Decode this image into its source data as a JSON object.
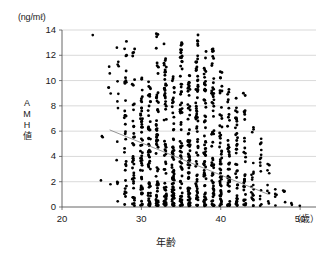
{
  "figure": {
    "y_unit_label": "(ng/mℓ)",
    "x_unit_label": "（歳）",
    "y_axis_title_chars": [
      "A",
      "M",
      "H",
      "値"
    ],
    "x_axis_title": "年齢"
  },
  "chart_data": {
    "type": "scatter",
    "title": "",
    "xlabel": "年齢",
    "ylabel": "AMH値",
    "y_unit": "ng/mℓ",
    "x_unit": "歳",
    "xlim": [
      20,
      52
    ],
    "ylim": [
      0,
      14
    ],
    "xticks": [
      20,
      30,
      40,
      50
    ],
    "yticks": [
      0,
      2,
      4,
      6,
      8,
      10,
      12,
      14
    ],
    "xtick_labels": [
      "20",
      "30",
      "40",
      "50"
    ],
    "ytick_labels": [
      "0",
      "2",
      "4",
      "6",
      "8",
      "10",
      "12",
      "14"
    ],
    "grid": "horizontal",
    "legend": "none",
    "marker_color": "#000000",
    "marker_shape": "circle",
    "trendline": {
      "present": true,
      "color": "#8a8a8a",
      "x_start": 26.0,
      "y_start": 6.1,
      "x_end": 46.0,
      "y_end": 1.0
    },
    "age_columns": [
      {
        "age": 24,
        "n": 1,
        "ymin": 13.6,
        "ymax": 13.6,
        "ytop": 13.6
      },
      {
        "age": 25,
        "n": 3,
        "ymin": 2.0,
        "ymax": 5.6,
        "ytop": 5.6
      },
      {
        "age": 26,
        "n": 6,
        "ymin": 1.7,
        "ymax": 11.1,
        "ytop": 11.1
      },
      {
        "age": 27,
        "n": 14,
        "ymin": 0.4,
        "ymax": 12.6,
        "ytop": 12.6
      },
      {
        "age": 28,
        "n": 34,
        "ymin": 0.1,
        "ymax": 13.1,
        "ytop": 13.1
      },
      {
        "age": 29,
        "n": 42,
        "ymin": 0.1,
        "ymax": 12.5,
        "ytop": 12.5
      },
      {
        "age": 30,
        "n": 52,
        "ymin": 0.1,
        "ymax": 10.2,
        "ytop": 10.2
      },
      {
        "age": 31,
        "n": 58,
        "ymin": 0.1,
        "ymax": 9.9,
        "ytop": 9.9
      },
      {
        "age": 32,
        "n": 62,
        "ymin": 0.1,
        "ymax": 13.7,
        "ytop": 13.7
      },
      {
        "age": 33,
        "n": 66,
        "ymin": 0.1,
        "ymax": 12.9,
        "ytop": 12.9
      },
      {
        "age": 34,
        "n": 70,
        "ymin": 0.1,
        "ymax": 10.3,
        "ytop": 10.3
      },
      {
        "age": 35,
        "n": 74,
        "ymin": 0.1,
        "ymax": 13.0,
        "ytop": 13.0
      },
      {
        "age": 36,
        "n": 72,
        "ymin": 0.1,
        "ymax": 10.4,
        "ytop": 10.4
      },
      {
        "age": 37,
        "n": 70,
        "ymin": 0.1,
        "ymax": 13.6,
        "ytop": 13.6
      },
      {
        "age": 38,
        "n": 66,
        "ymin": 0.1,
        "ymax": 12.3,
        "ytop": 12.3
      },
      {
        "age": 39,
        "n": 60,
        "ymin": 0.1,
        "ymax": 12.5,
        "ytop": 12.5
      },
      {
        "age": 40,
        "n": 54,
        "ymin": 0.1,
        "ymax": 10.7,
        "ytop": 10.7
      },
      {
        "age": 41,
        "n": 46,
        "ymin": 0.1,
        "ymax": 9.3,
        "ytop": 9.3
      },
      {
        "age": 42,
        "n": 40,
        "ymin": 0.1,
        "ymax": 8.6,
        "ytop": 8.6
      },
      {
        "age": 43,
        "n": 32,
        "ymin": 0.1,
        "ymax": 9.0,
        "ytop": 9.0
      },
      {
        "age": 44,
        "n": 22,
        "ymin": 0.1,
        "ymax": 6.3,
        "ytop": 6.3
      },
      {
        "age": 45,
        "n": 16,
        "ymin": 0.1,
        "ymax": 5.4,
        "ytop": 5.4
      },
      {
        "age": 46,
        "n": 10,
        "ymin": 0.1,
        "ymax": 3.4,
        "ytop": 3.4
      },
      {
        "age": 47,
        "n": 5,
        "ymin": 0.1,
        "ymax": 1.4,
        "ytop": 1.4
      },
      {
        "age": 48,
        "n": 4,
        "ymin": 0.1,
        "ymax": 1.3,
        "ytop": 1.3
      },
      {
        "age": 49,
        "n": 2,
        "ymin": 0.1,
        "ymax": 0.3,
        "ytop": 0.3
      },
      {
        "age": 50,
        "n": 1,
        "ymin": 0.1,
        "ymax": 0.1,
        "ytop": 0.1
      }
    ],
    "outliers": [
      {
        "age": 24,
        "value": 13.6
      },
      {
        "age": 26,
        "value": 11.1
      },
      {
        "age": 38,
        "value": 13.1
      },
      {
        "age": 43,
        "value": 9.0
      },
      {
        "age": 45,
        "value": 5.4
      },
      {
        "age": 46,
        "value": 3.4
      }
    ]
  }
}
